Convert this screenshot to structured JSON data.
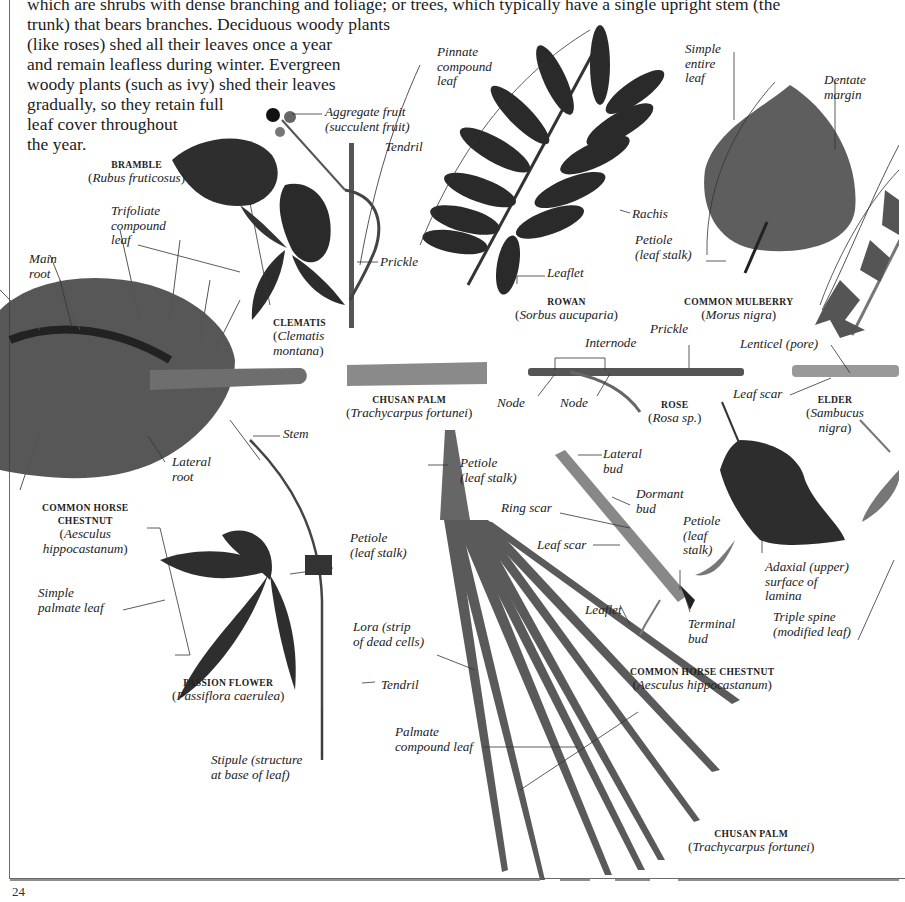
{
  "page": {
    "number": "24",
    "intro_lines": [
      "which are shrubs with dense branching and foliage; or trees, which typically have a single upright stem (the",
      "trunk) that bears branches. Deciduous woody plants",
      "(like roses) shed all their leaves once a year",
      "and remain leafless during winter. Evergreen",
      "woody plants (such as ivy) shed their leaves",
      "gradually, so they retain full",
      "leaf cover throughout",
      "the year."
    ]
  },
  "specimens": [
    {
      "id": "bramble",
      "name": "BRAMBLE",
      "sci": "Rubus fruticosus"
    },
    {
      "id": "clematis",
      "name": "CLEMATIS",
      "sci_lines": [
        "Clematis",
        "montana"
      ]
    },
    {
      "id": "rowan",
      "name": "ROWAN",
      "sci": "Sorbus aucuparia"
    },
    {
      "id": "mulberry",
      "name": "COMMON MULBERRY",
      "sci": "Morus nigra"
    },
    {
      "id": "chusan-stem",
      "name": "CHUSAN PALM",
      "sci": "Trachycarpus fortunei"
    },
    {
      "id": "rose",
      "name": "ROSE",
      "sci": "Rosa sp."
    },
    {
      "id": "elder",
      "name": "ELDER",
      "sci_lines": [
        "Sambucus",
        "nigra"
      ]
    },
    {
      "id": "horse-chestnut-root",
      "name_lines": [
        "COMMON HORSE",
        "CHESTNUT"
      ],
      "sci_lines": [
        "Aesculus",
        "hippocastanum"
      ]
    },
    {
      "id": "passion-flower",
      "name": "PASSION FLOWER",
      "sci": "Passiflora caerulea"
    },
    {
      "id": "horse-chestnut-twig",
      "name": "COMMON HORSE CHESTNUT",
      "sci": "Aesculus hippocastanum"
    },
    {
      "id": "chusan-leaf",
      "name": "CHUSAN PALM",
      "sci": "Trachycarpus fortunei"
    }
  ],
  "labels": {
    "aggregate_fruit": [
      "Aggregate fruit",
      "(succulent fruit)"
    ],
    "tendril_bramble": [
      "Tendril"
    ],
    "trifoliate": [
      "Trifoliate",
      "compound",
      "leaf"
    ],
    "main_root": [
      "Main",
      "root"
    ],
    "prickle_bramble": [
      "Prickle"
    ],
    "pinnate": [
      "Pinnate",
      "compound",
      "leaf"
    ],
    "rachis": [
      "Rachis"
    ],
    "leaflet_rowan": [
      "Leaflet"
    ],
    "simple_entire": [
      "Simple",
      "entire",
      "leaf"
    ],
    "dentate": [
      "Dentate",
      "margin"
    ],
    "petiole_mulberry": [
      "Petiole",
      "(leaf stalk)"
    ],
    "internode": [
      "Internode"
    ],
    "prickle_rose": [
      "Prickle"
    ],
    "node1": [
      "Node"
    ],
    "node2": [
      "Node"
    ],
    "lenticel": [
      "Lenticel (pore)"
    ],
    "leaf_scar_elder": [
      "Leaf scar"
    ],
    "stem": [
      "Stem"
    ],
    "lateral_root": [
      "Lateral",
      "root"
    ],
    "petiole_palm": [
      "Petiole",
      "(leaf stalk)"
    ],
    "lateral_bud": [
      "Lateral",
      "bud"
    ],
    "dormant_bud": [
      "Dormant",
      "bud"
    ],
    "ring_scar": [
      "Ring scar"
    ],
    "leaf_scar_hc": [
      "Leaf scar"
    ],
    "petiole_hc": [
      "Petiole",
      "(leaf",
      "stalk)"
    ],
    "adaxial": [
      "Adaxial (upper)",
      "surface of",
      "lamina"
    ],
    "simple_palmate": [
      "Simple",
      "palmate leaf"
    ],
    "petiole_passion": [
      "Petiole",
      "(leaf stalk)"
    ],
    "lora": [
      "Lora (strip",
      "of dead cells)"
    ],
    "leaflet_hc": [
      "Leaflet"
    ],
    "terminal_bud": [
      "Terminal",
      "bud"
    ],
    "triple_spine": [
      "Triple spine",
      "(modified leaf)"
    ],
    "tendril_passion": [
      "Tendril"
    ],
    "palmate_compound": [
      "Palmate",
      "compound leaf"
    ],
    "stipule": [
      "Stipule (structure",
      "at base of leaf)"
    ]
  },
  "colors": {
    "ink": "#1e1e1e",
    "leaf_dark": "#2b2b2b",
    "leaf_mid": "#555555",
    "leaf_light": "#6e6e6e",
    "stem": "#7a7a7a",
    "root": "#3a3a3a",
    "frame": "#6a6a6a"
  }
}
